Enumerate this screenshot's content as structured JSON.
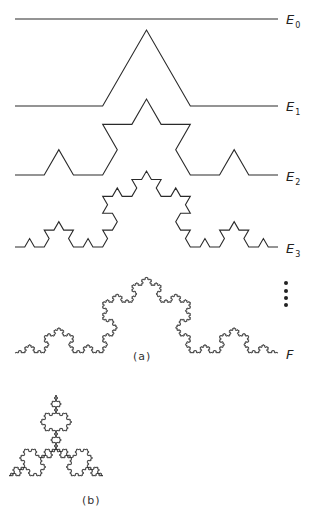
{
  "figure": {
    "stroke_color": "#2a2a2a",
    "background": "#ffffff",
    "curves": [
      {
        "id": "E0",
        "label": "E",
        "subscript": "0",
        "order": 0,
        "start": [
          15,
          19
        ],
        "end": [
          278,
          19
        ],
        "label_pos": [
          286,
          13
        ]
      },
      {
        "id": "E1",
        "label": "E",
        "subscript": "1",
        "order": 1,
        "start": [
          15,
          106
        ],
        "end": [
          278,
          106
        ],
        "label_pos": [
          286,
          100
        ]
      },
      {
        "id": "E2",
        "label": "E",
        "subscript": "2",
        "order": 2,
        "start": [
          15,
          175
        ],
        "end": [
          278,
          175
        ],
        "label_pos": [
          286,
          170
        ]
      },
      {
        "id": "E3",
        "label": "E",
        "subscript": "3",
        "order": 3,
        "start": [
          15,
          247
        ],
        "end": [
          278,
          247
        ],
        "label_pos": [
          286,
          242
        ]
      },
      {
        "id": "F",
        "label": "F",
        "subscript": "",
        "order": 6,
        "start": [
          15,
          353
        ],
        "end": [
          278,
          353
        ],
        "label_pos": [
          286,
          348
        ]
      }
    ],
    "continuation_dots": {
      "x": 286,
      "y": [
        283,
        291,
        298,
        305
      ]
    },
    "caption_a": {
      "text": "(a)",
      "pos": [
        133,
        351
      ]
    },
    "snowflake": {
      "order": 5,
      "center": [
        56,
        449
      ],
      "radius": 54,
      "caption": "(b)",
      "caption_pos": [
        82,
        495
      ]
    }
  }
}
